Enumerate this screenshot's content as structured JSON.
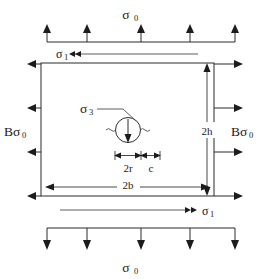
{
  "figure": {
    "title_text": "",
    "colors": {
      "stroke": "#2b2b2b",
      "text": "#1a1a1a",
      "background": "#ffffff"
    },
    "labels": {
      "sigma_0_top": "σ",
      "sigma_0_top_sub": "0",
      "sigma_0_bottom": "σ",
      "sigma_0_bottom_sub": "0",
      "sigma_1_top": "σ",
      "sigma_1_top_sub": "1",
      "sigma_1_bottom": "σ",
      "sigma_1_bottom_sub": "1",
      "sigma_3_center": "σ",
      "sigma_3_center_sub": "3",
      "b_sigma_0_left_prefix": "B",
      "b_sigma_0_left": "σ",
      "b_sigma_0_left_sub": "0",
      "b_sigma_0_right_prefix": "B",
      "b_sigma_0_right": "σ",
      "b_sigma_0_right_sub": "0",
      "dim_height": "2h",
      "dim_width": "2b",
      "dim_hole_diameter": "2r",
      "dim_ligament": "c"
    },
    "geometry": {
      "plate_left": 41,
      "plate_right": 214,
      "plate_top": 63,
      "plate_bottom": 196,
      "hole_center_x": 128,
      "hole_center_y": 130,
      "hole_radius": 12.5,
      "top_load_bar_y": 42,
      "bottom_load_bar_y": 236,
      "top_arrow_count": 5,
      "bottom_arrow_count": 5,
      "left_arrow_count": 4,
      "right_arrow_count": 4
    },
    "icons": {
      "up_arrow": "arrow-up",
      "down_arrow": "arrow-down",
      "left_arrow": "arrow-left",
      "right_arrow": "arrow-right",
      "hole": "circular-hole",
      "internal_load_arrow": "arrow-down-in-hole"
    }
  }
}
